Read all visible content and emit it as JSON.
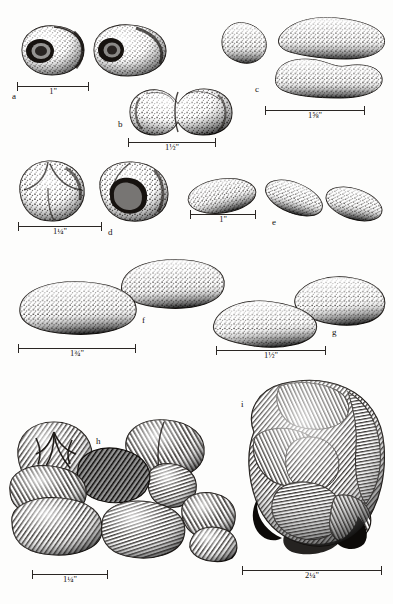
{
  "plate": {
    "title": "Specimen illustration plate",
    "medium": "pen-and-ink stipple and hatching",
    "background_color": "#fdfdfc",
    "ink_color": "#15120f",
    "width": 393,
    "height": 604
  },
  "figures": [
    {
      "key": "a",
      "label": "a",
      "count": 2,
      "scale_label": "1\"",
      "scale_whole": "1",
      "scale_fraction": "",
      "scale_unit": "\"",
      "description": "two ovoid specimens with dark concave cup-shaped openings"
    },
    {
      "key": "b",
      "label": "b",
      "count": 1,
      "scale_label": "1½\"",
      "scale_whole": "1",
      "scale_fraction": "½",
      "scale_unit": "\"",
      "description": "single bilobed specimen with central constriction"
    },
    {
      "key": "c",
      "label": "c",
      "count": 3,
      "scale_label": "1⅝\"",
      "scale_whole": "1",
      "scale_fraction": "⅝",
      "scale_unit": "\"",
      "description": "three elongate kidney-shaped specimens, coarse stipple"
    },
    {
      "key": "d",
      "label": "d",
      "count": 2,
      "scale_label": "1¼\"",
      "scale_whole": "1",
      "scale_fraction": "¼",
      "scale_unit": "\"",
      "description": "two lobed rounded specimens, one with deep hollow"
    },
    {
      "key": "e",
      "label": "e",
      "count": 3,
      "scale_label": "1\"",
      "scale_whole": "1",
      "scale_fraction": "",
      "scale_unit": "\"",
      "description": "three small smooth ellipsoidal specimens"
    },
    {
      "key": "f",
      "label": "f",
      "count": 2,
      "scale_label": "1¾\"",
      "scale_whole": "1",
      "scale_fraction": "¾",
      "scale_unit": "\"",
      "description": "two large flattened ovate specimens"
    },
    {
      "key": "g",
      "label": "g",
      "count": 2,
      "scale_label": "1½\"",
      "scale_whole": "1",
      "scale_fraction": "½",
      "scale_unit": "\"",
      "description": "two pointed lens-shaped specimens"
    },
    {
      "key": "h",
      "label": "h",
      "count": 9,
      "scale_label": "1¼\"",
      "scale_whole": "1",
      "scale_fraction": "¼",
      "scale_unit": "\"",
      "description": "cluster of nine rounded lobed specimens rendered in line hatching"
    },
    {
      "key": "i",
      "label": "i",
      "count": 1,
      "scale_label": "2¼\"",
      "scale_whole": "2",
      "scale_fraction": "¼",
      "scale_unit": "\"",
      "description": "single large convoluted mass with many fused lobes"
    }
  ]
}
